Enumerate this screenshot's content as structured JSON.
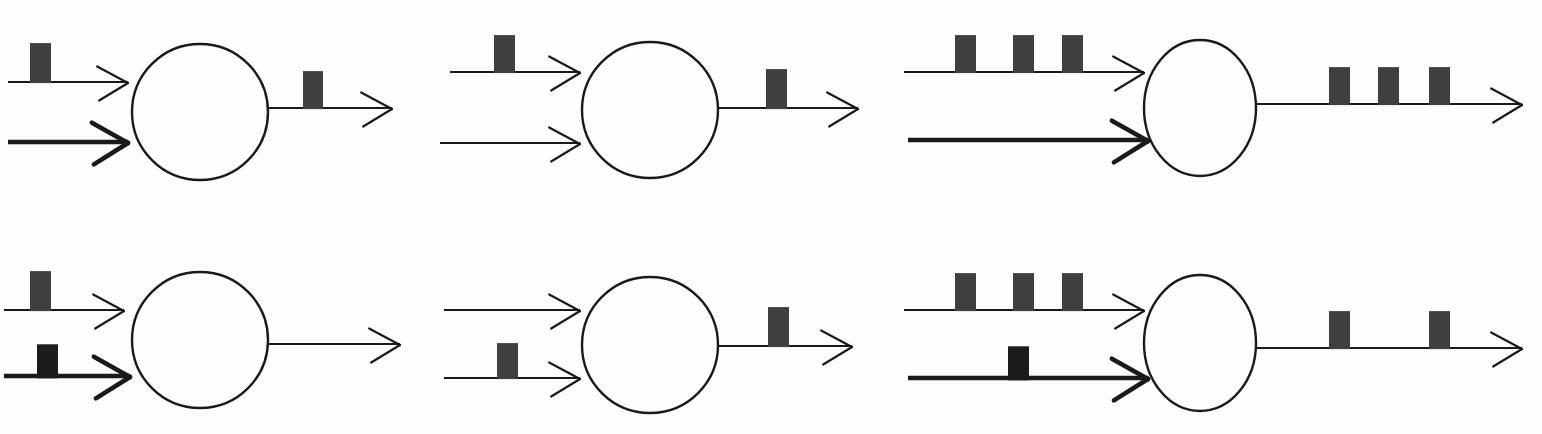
{
  "figure": {
    "type": "neuron-spike-diagram",
    "width": 1542,
    "height": 434,
    "rows": 2,
    "columns": 3,
    "background_color": "#fdfdfd",
    "stroke_color": "#1a1a1a",
    "spike_color": "#3f3f3f",
    "spike_color_inhibitory": "#1c1c1c"
  },
  "legend": {
    "thin_line_meaning": "excitatory input",
    "thick_line_meaning": "inhibitory input",
    "spike_meaning": "action potential / pulse"
  },
  "panels": [
    {
      "id": "panel-1",
      "position": "top-left",
      "soma": {
        "cx": 200,
        "cy": 112,
        "rx": 68,
        "ry": 68
      },
      "inputs": [
        {
          "role": "excitatory",
          "line_weight": "thin",
          "stroke_width": 2.2,
          "x1": 8,
          "x2": 128,
          "y": 82,
          "spikes": [
            {
              "x": 30,
              "width": 21,
              "height": 40,
              "dark": false
            }
          ],
          "spike_count": 1
        },
        {
          "role": "inhibitory",
          "line_weight": "thick",
          "stroke_width": 4.6,
          "x1": 8,
          "x2": 128,
          "y": 142,
          "spikes": [],
          "spike_count": 0
        }
      ],
      "output": {
        "role": "axon",
        "line_weight": "thin",
        "stroke_width": 2.2,
        "x1": 266,
        "x2": 392,
        "y": 108,
        "spikes": [
          {
            "x": 303,
            "width": 20,
            "height": 38,
            "dark": false
          }
        ],
        "spike_count": 1
      }
    },
    {
      "id": "panel-2",
      "position": "top-middle",
      "soma": {
        "cx": 650,
        "cy": 110,
        "rx": 68,
        "ry": 68
      },
      "inputs": [
        {
          "role": "excitatory",
          "line_weight": "thin",
          "stroke_width": 2.2,
          "x1": 450,
          "x2": 580,
          "y": 72,
          "spikes": [
            {
              "x": 494,
              "width": 21,
              "height": 38,
              "dark": false
            }
          ],
          "spike_count": 1
        },
        {
          "role": "excitatory-secondary",
          "line_weight": "thin",
          "stroke_width": 2.2,
          "x1": 440,
          "x2": 580,
          "y": 143,
          "spikes": [],
          "spike_count": 0
        }
      ],
      "output": {
        "role": "axon",
        "line_weight": "thin",
        "stroke_width": 2.2,
        "x1": 718,
        "x2": 858,
        "y": 108,
        "spikes": [
          {
            "x": 766,
            "width": 21,
            "height": 40,
            "dark": false
          }
        ],
        "spike_count": 1
      }
    },
    {
      "id": "panel-3",
      "position": "top-right",
      "soma": {
        "cx": 1200,
        "cy": 108,
        "rx": 56,
        "ry": 68
      },
      "inputs": [
        {
          "role": "excitatory",
          "line_weight": "thin",
          "stroke_width": 2.2,
          "x1": 904,
          "x2": 1144,
          "y": 72,
          "spikes": [
            {
              "x": 955,
              "width": 21,
              "height": 38,
              "dark": false
            },
            {
              "x": 1013,
              "width": 21,
              "height": 38,
              "dark": false
            },
            {
              "x": 1062,
              "width": 21,
              "height": 38,
              "dark": false
            }
          ],
          "spike_count": 3
        },
        {
          "role": "inhibitory",
          "line_weight": "thick",
          "stroke_width": 4.6,
          "x1": 908,
          "x2": 1148,
          "y": 140,
          "spikes": [],
          "spike_count": 0
        }
      ],
      "output": {
        "role": "axon",
        "line_weight": "thin",
        "stroke_width": 2.2,
        "x1": 1256,
        "x2": 1522,
        "y": 104,
        "spikes": [
          {
            "x": 1329,
            "width": 21,
            "height": 38,
            "dark": false
          },
          {
            "x": 1378,
            "width": 21,
            "height": 38,
            "dark": false
          },
          {
            "x": 1429,
            "width": 21,
            "height": 38,
            "dark": false
          }
        ],
        "spike_count": 3
      }
    },
    {
      "id": "panel-4",
      "position": "bottom-left",
      "soma": {
        "cx": 200,
        "cy": 340,
        "rx": 68,
        "ry": 68
      },
      "inputs": [
        {
          "role": "excitatory",
          "line_weight": "thin",
          "stroke_width": 2.2,
          "x1": 4,
          "x2": 124,
          "y": 310,
          "spikes": [
            {
              "x": 30,
              "width": 21,
              "height": 40,
              "dark": false
            }
          ],
          "spike_count": 1
        },
        {
          "role": "inhibitory",
          "line_weight": "thick",
          "stroke_width": 4.6,
          "x1": 4,
          "x2": 130,
          "y": 376,
          "spikes": [
            {
              "x": 37,
              "width": 21,
              "height": 34,
              "dark": true
            }
          ],
          "spike_count": 1
        }
      ],
      "output": {
        "role": "axon",
        "line_weight": "thin",
        "stroke_width": 2.2,
        "x1": 266,
        "x2": 400,
        "y": 344,
        "spikes": [],
        "spike_count": 0
      }
    },
    {
      "id": "panel-5",
      "position": "bottom-middle",
      "soma": {
        "cx": 650,
        "cy": 345,
        "rx": 68,
        "ry": 68
      },
      "inputs": [
        {
          "role": "excitatory",
          "line_weight": "thin",
          "stroke_width": 2.2,
          "x1": 444,
          "x2": 580,
          "y": 310,
          "spikes": [],
          "spike_count": 0
        },
        {
          "role": "excitatory-secondary",
          "line_weight": "thin",
          "stroke_width": 2.2,
          "x1": 444,
          "x2": 580,
          "y": 378,
          "spikes": [
            {
              "x": 497,
              "width": 21,
              "height": 36,
              "dark": false
            }
          ],
          "spike_count": 1
        }
      ],
      "output": {
        "role": "axon",
        "line_weight": "thin",
        "stroke_width": 2.2,
        "x1": 718,
        "x2": 852,
        "y": 346,
        "spikes": [
          {
            "x": 768,
            "width": 21,
            "height": 40,
            "dark": false
          }
        ],
        "spike_count": 1
      }
    },
    {
      "id": "panel-6",
      "position": "bottom-right",
      "soma": {
        "cx": 1200,
        "cy": 343,
        "rx": 56,
        "ry": 68
      },
      "inputs": [
        {
          "role": "excitatory",
          "line_weight": "thin",
          "stroke_width": 2.2,
          "x1": 904,
          "x2": 1144,
          "y": 310,
          "spikes": [
            {
              "x": 955,
              "width": 21,
              "height": 38,
              "dark": false
            },
            {
              "x": 1013,
              "width": 21,
              "height": 38,
              "dark": false
            },
            {
              "x": 1062,
              "width": 21,
              "height": 38,
              "dark": false
            }
          ],
          "spike_count": 3
        },
        {
          "role": "inhibitory",
          "line_weight": "thick",
          "stroke_width": 4.6,
          "x1": 908,
          "x2": 1148,
          "y": 378,
          "spikes": [
            {
              "x": 1008,
              "width": 21,
              "height": 34,
              "dark": true
            }
          ],
          "spike_count": 1
        }
      ],
      "output": {
        "role": "axon",
        "line_weight": "thin",
        "stroke_width": 2.2,
        "x1": 1256,
        "x2": 1522,
        "y": 348,
        "spikes": [
          {
            "x": 1329,
            "width": 21,
            "height": 38,
            "dark": false
          },
          {
            "x": 1429,
            "width": 21,
            "height": 38,
            "dark": false
          }
        ],
        "spike_count": 2
      }
    }
  ]
}
